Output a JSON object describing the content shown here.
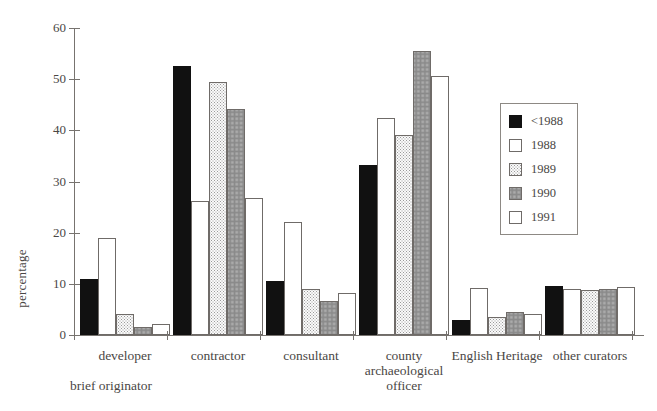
{
  "chart_data": {
    "type": "bar",
    "title": "",
    "xlabel": "brief originator",
    "ylabel": "percentage",
    "ylim": [
      0,
      60
    ],
    "yticks": [
      0,
      10,
      20,
      30,
      40,
      50,
      60
    ],
    "grid": false,
    "legend_position": "right-inside",
    "categories": [
      "developer",
      "contractor",
      "consultant",
      "county archaeological officer",
      "English Heritage",
      "other curators"
    ],
    "category_lines": [
      [
        "developer"
      ],
      [
        "contractor"
      ],
      [
        "consultant"
      ],
      [
        "county",
        "archaeological",
        "officer"
      ],
      [
        "English Heritage"
      ],
      [
        "other curators"
      ]
    ],
    "series": [
      {
        "name": "<1988",
        "fill": "solid-black",
        "color": "#111111",
        "values": [
          11.0,
          52.5,
          10.5,
          33.2,
          3.0,
          9.6
        ]
      },
      {
        "name": "1988",
        "fill": "white-outline",
        "color": "#ffffff",
        "values": [
          19.0,
          26.2,
          22.0,
          42.5,
          9.2,
          9.0
        ]
      },
      {
        "name": "1989",
        "fill": "light-stipple",
        "color": "#fafafa",
        "values": [
          4.1,
          49.4,
          9.0,
          39.0,
          3.6,
          8.8
        ]
      },
      {
        "name": "1990",
        "fill": "medium-stipple",
        "color": "#f2f2f2",
        "values": [
          1.6,
          44.1,
          6.6,
          55.6,
          4.5,
          9.0
        ]
      },
      {
        "name": "1991",
        "fill": "white-outline",
        "color": "#ffffff",
        "values": [
          2.1,
          26.8,
          8.3,
          50.6,
          4.1,
          9.3
        ]
      }
    ]
  },
  "legend": {
    "entries": [
      {
        "label": "<1988"
      },
      {
        "label": "1988"
      },
      {
        "label": "1989"
      },
      {
        "label": "1990"
      },
      {
        "label": "1991"
      }
    ]
  },
  "axis": {
    "y_title": "percentage",
    "x_title": "brief originator",
    "tick_labels": [
      "0",
      "10",
      "20",
      "30",
      "40",
      "50",
      "60"
    ]
  }
}
